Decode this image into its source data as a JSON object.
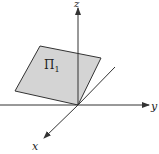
{
  "diagram": {
    "axes": {
      "z_label": "z",
      "y_label": "y",
      "x_label": "x"
    },
    "plane": {
      "label": "Π",
      "subscript": "1",
      "fill": "#d4d4d4",
      "stroke": "#333333"
    },
    "colors": {
      "axis": "#333333",
      "background": "#ffffff"
    }
  }
}
